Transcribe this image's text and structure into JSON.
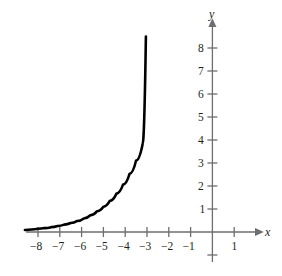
{
  "chart_data": {
    "type": "line",
    "title": "",
    "xlabel": "x",
    "ylabel": "y",
    "xlim": [
      -8.6,
      1.9
    ],
    "ylim": [
      -1.3,
      8.9
    ],
    "grid": false,
    "legend": null,
    "annotations": [],
    "x_ticks": [
      -8,
      -7,
      -6,
      -5,
      -4,
      -3,
      -2,
      -1,
      1
    ],
    "x_tick_labels": [
      "−8",
      "−7",
      "−6",
      "−5",
      "−4",
      "−3",
      "−2",
      "−1",
      "1"
    ],
    "y_ticks": [
      1,
      2,
      3,
      4,
      5,
      6,
      7,
      8
    ],
    "y_tick_labels": [
      "1",
      "2",
      "3",
      "4",
      "5",
      "6",
      "7",
      "8"
    ],
    "series": [
      {
        "name": "exponential-curve",
        "color": "#000000",
        "line_width": 2.6,
        "x": [
          -8.6,
          -8.3,
          -8.0,
          -7.7,
          -7.4,
          -7.1,
          -6.8,
          -6.5,
          -6.2,
          -5.9,
          -5.6,
          -5.3,
          -5.0,
          -4.7,
          -4.4,
          -4.1,
          -3.8,
          -3.5,
          -3.2,
          -3.05
        ],
        "y": [
          0.09,
          0.11,
          0.14,
          0.17,
          0.21,
          0.26,
          0.32,
          0.39,
          0.48,
          0.59,
          0.73,
          0.9,
          1.1,
          1.36,
          1.67,
          2.06,
          2.53,
          3.11,
          3.83,
          8.5
        ],
        "note": "y = 2^(x+6), drawn from x = -8.6 to x = -3 with the terminal stroke rising to about y = 8.5"
      }
    ]
  },
  "axes": {
    "x_axis_label": "x",
    "y_axis_label": "y",
    "x_axis_arrow": true,
    "y_axis_arrow": true,
    "axis_color": "#6d6e71"
  },
  "colors": {
    "background": "#ffffff",
    "curve": "#000000",
    "axis": "#6d6e71",
    "text": "#231f20"
  }
}
